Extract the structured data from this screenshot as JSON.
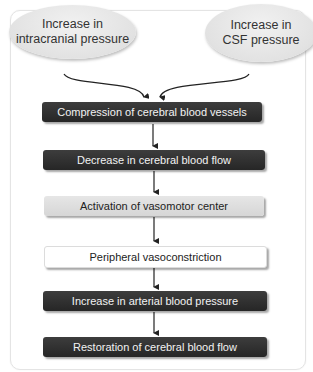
{
  "diagram": {
    "type": "flowchart",
    "sources": [
      {
        "id": "icp",
        "line1": "Increase in",
        "line2": "intracranial pressure"
      },
      {
        "id": "csf",
        "line1": "Increase in",
        "line2": "CSF pressure"
      }
    ],
    "steps": [
      {
        "label": "Compression of cerebral blood vessels",
        "style": "dark"
      },
      {
        "label": "Decrease in cerebral blood flow",
        "style": "dark"
      },
      {
        "label": "Activation of vasomotor center",
        "style": "gray"
      },
      {
        "label": "Peripheral vasoconstriction",
        "style": "white"
      },
      {
        "label": "Increase in arterial blood pressure",
        "style": "dark"
      },
      {
        "label": "Restoration of cerebral blood flow",
        "style": "dark"
      }
    ],
    "colors": {
      "dark_box": "#2e2e2e",
      "gray_box": "#dedede",
      "white_box": "#ffffff",
      "ellipse": "#e2e2e2",
      "arrow": "#222222"
    }
  }
}
